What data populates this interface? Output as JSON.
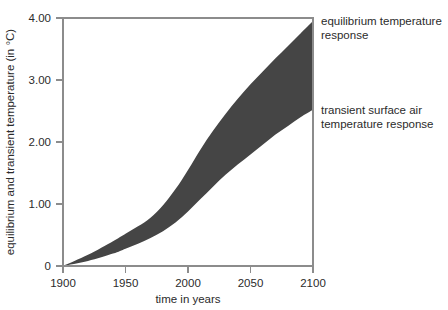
{
  "chart_data": {
    "type": "area",
    "title": "",
    "xlabel": "time in years",
    "ylabel": "equilibrium and transient temperature (in °C)",
    "xlim": [
      1900,
      2100
    ],
    "ylim": [
      0,
      4.0
    ],
    "xticks": [
      1900,
      1950,
      2000,
      2050,
      2100
    ],
    "xticklabels": [
      "1900",
      "1950",
      "2000",
      "2050",
      "2100"
    ],
    "yticks": [
      0,
      1.0,
      2.0,
      3.0,
      4.0
    ],
    "yticklabels": [
      "0",
      "1.00",
      "2.00",
      "3.00",
      "4.00"
    ],
    "grid": false,
    "legend_position": "right-inline-annotations",
    "band_fill_color": "#454545",
    "axis_color": "#8c8c8c",
    "series": [
      {
        "name": "equilibrium temperature response",
        "role": "upper-bound",
        "x": [
          1900,
          1920,
          1940,
          1950,
          1960,
          1970,
          1980,
          1990,
          2000,
          2010,
          2020,
          2030,
          2040,
          2050,
          2060,
          2070,
          2080,
          2090,
          2100
        ],
        "values": [
          0.0,
          0.18,
          0.4,
          0.52,
          0.64,
          0.78,
          0.98,
          1.24,
          1.55,
          1.88,
          2.18,
          2.45,
          2.7,
          2.93,
          3.14,
          3.35,
          3.55,
          3.75,
          3.95
        ]
      },
      {
        "name": "transient surface air temperature response",
        "role": "lower-bound",
        "x": [
          1900,
          1920,
          1940,
          1950,
          1960,
          1970,
          1980,
          1990,
          2000,
          2010,
          2020,
          2030,
          2040,
          2050,
          2060,
          2070,
          2080,
          2090,
          2100
        ],
        "values": [
          0.0,
          0.08,
          0.2,
          0.28,
          0.36,
          0.45,
          0.56,
          0.7,
          0.88,
          1.08,
          1.28,
          1.47,
          1.64,
          1.8,
          1.96,
          2.12,
          2.26,
          2.4,
          2.52
        ]
      }
    ],
    "annotations": [
      {
        "name": "equilibrium-annotation",
        "lines": [
          "equilibrium temperature",
          "response"
        ],
        "anchor_year": 2100,
        "anchor_value": 3.95
      },
      {
        "name": "transient-annotation",
        "lines": [
          "transient surface air",
          "temperature response"
        ],
        "anchor_year": 2100,
        "anchor_value": 2.52
      }
    ]
  }
}
